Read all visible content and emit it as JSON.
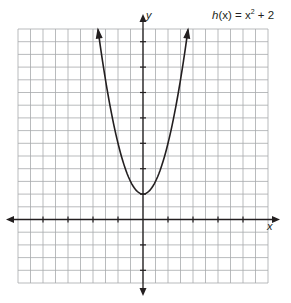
{
  "chart_data": {
    "type": "line",
    "function": "h(x) = x^2 + 2",
    "xlabel": "x",
    "ylabel": "y",
    "xlim": [
      -10,
      10
    ],
    "ylim": [
      -5,
      15
    ],
    "grid": true,
    "grid_step": 1,
    "tick_step": 2,
    "tick_labels_shown": false,
    "series": [
      {
        "name": "h(x) = x² + 2",
        "x": [
          -3.6,
          -3,
          -2,
          -1,
          0,
          1,
          2,
          3,
          3.6
        ],
        "y": [
          14.96,
          11,
          6,
          3,
          2,
          3,
          6,
          11,
          14.96
        ],
        "vertex": [
          0,
          2
        ],
        "arrows_at_ends": true
      }
    ]
  },
  "labels": {
    "function_prefix": "h",
    "function_paren": "(x)",
    "function_rest": " = x",
    "function_exp": "2",
    "function_tail": " + 2",
    "x_axis": "x",
    "y_axis": "y"
  },
  "colors": {
    "grid": "#a7a9ac",
    "axis": "#231f20",
    "curve": "#231f20"
  }
}
